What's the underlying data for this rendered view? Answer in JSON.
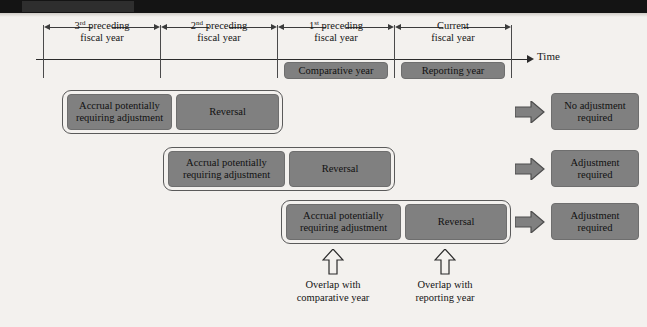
{
  "banner": {
    "tag_text": "",
    "color": "#141414"
  },
  "colors": {
    "page_background": "#f3f1ee",
    "box_fill": "#808080",
    "box_border": "#6e6e6e",
    "group_border": "#5a5a5a",
    "line": "#2b2b2b",
    "text": "#141414"
  },
  "timeline": {
    "axis_label": "Time",
    "spans": [
      {
        "line1": "3",
        "sup": "rd",
        "line1b": " preceding",
        "line2": "fiscal year"
      },
      {
        "line1": "2",
        "sup": "nd",
        "line1b": " preceding",
        "line2": "fiscal year"
      },
      {
        "line1": "1",
        "sup": "st",
        "line1b": " preceding",
        "line2": "fiscal year"
      },
      {
        "line1": "",
        "sup": "",
        "line1b": "Current",
        "line2": "fiscal year"
      }
    ],
    "period_boxes": [
      {
        "label": "Comparative year"
      },
      {
        "label": "Reporting year"
      }
    ]
  },
  "scenarios": [
    {
      "accrual_label_line1": "Accrual potentially",
      "accrual_label_line2": "requiring adjustment",
      "reversal_label": "Reversal",
      "outcome_line1": "No adjustment",
      "outcome_line2": "required"
    },
    {
      "accrual_label_line1": "Accrual potentially",
      "accrual_label_line2": "requiring adjustment",
      "reversal_label": "Reversal",
      "outcome_line1": "Adjustment",
      "outcome_line2": "required"
    },
    {
      "accrual_label_line1": "Accrual potentially",
      "accrual_label_line2": "requiring adjustment",
      "reversal_label": "Reversal",
      "outcome_line1": "Adjustment",
      "outcome_line2": "required"
    }
  ],
  "annotations": [
    {
      "line1": "Overlap with",
      "line2": "comparative year"
    },
    {
      "line1": "Overlap with",
      "line2": "reporting year"
    }
  ]
}
